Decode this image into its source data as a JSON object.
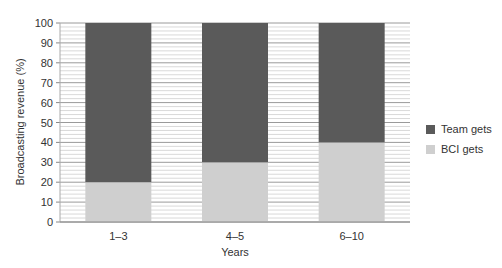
{
  "chart_data": {
    "type": "bar",
    "stacked": true,
    "title": "",
    "xlabel": "Years",
    "ylabel": "Broadcasting revenue (%)",
    "categories": [
      "1–3",
      "4–5",
      "6–10"
    ],
    "series": [
      {
        "name": "BCI gets",
        "values": [
          20,
          30,
          40
        ],
        "color": "#cfcfcf"
      },
      {
        "name": "Team gets",
        "values": [
          80,
          70,
          60
        ],
        "color": "#5a5a5a"
      }
    ],
    "ylim": [
      0,
      100
    ],
    "yticks": [
      0,
      10,
      20,
      30,
      40,
      50,
      60,
      70,
      80,
      90,
      100
    ],
    "grid": {
      "major_step": 10,
      "minor_step": 2
    },
    "legend": {
      "position": "right",
      "entries": [
        "Team gets",
        "BCI gets"
      ]
    }
  }
}
